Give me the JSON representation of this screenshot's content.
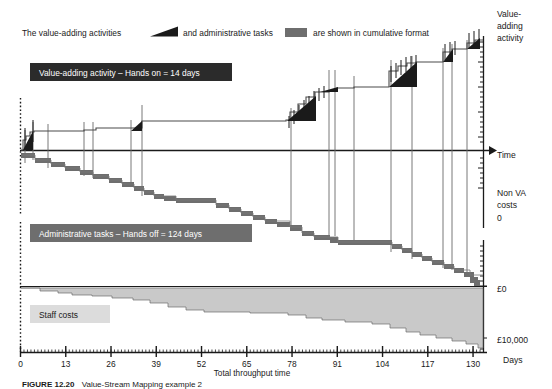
{
  "legend": {
    "prefix": "The value-adding activities",
    "middle": "and administrative tasks",
    "suffix": "are shown in cumulative format",
    "swatch_value_adding": "value-adding-wedge",
    "swatch_admin": "admin-block",
    "color_value_adding": "#1a1a1a",
    "color_admin": "#6e6e6e"
  },
  "callouts": {
    "value_adding": "Value-adding activity – Hands on = 14 days",
    "administrative": "Administrative tasks – Hands off = 124 days",
    "staff_costs": "Staff costs"
  },
  "axes": {
    "x_title": "Total throughput time",
    "x_unit_label": "Days",
    "x_ticks": [
      "0",
      "13",
      "26",
      "39",
      "52",
      "65",
      "78",
      "91",
      "104",
      "117",
      "130"
    ],
    "x_min": 0,
    "x_max": 133,
    "right_labels": {
      "top": "Value-adding activity",
      "time": "Time",
      "non_va": "Non VA costs",
      "zero_upper": "0",
      "money_zero": "£0",
      "money_ten_k": "£10,000"
    }
  },
  "caption": {
    "figure_no": "FIGURE 12.20",
    "text": "Value-Stream Mapping example 2"
  },
  "chart_data": {
    "type": "area",
    "xlabel": "Total throughput time",
    "ylabel": "Value-adding activity / Non VA costs / Staff costs",
    "xlim": [
      0,
      133
    ],
    "x_tick_values": [
      0,
      13,
      26,
      39,
      52,
      65,
      78,
      91,
      104,
      117,
      130
    ],
    "grid": false,
    "legend_position": "top",
    "annotations": [
      "Value-adding activity – Hands on = 14 days",
      "Administrative tasks – Hands off = 124 days",
      "Staff costs"
    ],
    "series": [
      {
        "name": "Value-adding activity (cumulative, upward staircase)",
        "units": "days hands-on",
        "total": 14,
        "x": [
          0,
          1,
          2,
          3,
          5,
          7,
          9,
          11,
          14,
          20,
          30,
          38,
          40,
          42,
          44,
          46,
          55,
          60,
          62,
          64,
          66,
          68,
          70,
          72,
          74,
          76,
          78,
          80,
          82,
          84,
          86,
          88,
          90,
          92,
          94,
          95,
          99,
          101,
          103,
          105,
          107,
          109,
          111,
          113,
          115,
          117,
          119,
          121,
          123,
          125,
          127,
          129,
          131,
          133
        ],
        "y": [
          0.0,
          0.3,
          0.7,
          1.1,
          1.4,
          1.5,
          1.6,
          1.7,
          1.8,
          1.8,
          1.8,
          1.9,
          2.2,
          2.5,
          2.9,
          3.0,
          3.0,
          3.0,
          3.4,
          3.9,
          4.4,
          4.9,
          5.4,
          5.8,
          6.2,
          6.6,
          7.0,
          7.0,
          7.0,
          7.0,
          7.0,
          7.0,
          7.0,
          7.0,
          7.0,
          9.0,
          9.6,
          10.2,
          10.8,
          11.0,
          11.0,
          11.6,
          12.2,
          12.6,
          12.9,
          13.0,
          13.4,
          13.6,
          13.8,
          14.0,
          14.0,
          14.0,
          14.0,
          14.0
        ]
      },
      {
        "name": "Administrative tasks (cumulative, downward staircase)",
        "units": "days hands-off",
        "total": 124,
        "x": [
          0,
          3,
          6,
          9,
          12,
          15,
          18,
          22,
          26,
          30,
          34,
          38,
          42,
          46,
          50,
          54,
          58,
          62,
          66,
          70,
          74,
          78,
          82,
          86,
          90,
          94,
          98,
          102,
          106,
          110,
          114,
          118,
          122,
          126,
          130,
          133
        ],
        "y": [
          0,
          -6,
          -10,
          -13,
          -16,
          -19,
          -22,
          -26,
          -28,
          -31,
          -34,
          -38,
          -42,
          -46,
          -50,
          -54,
          -58,
          -62,
          -66,
          -70,
          -72,
          -74,
          -74,
          -76,
          -80,
          -86,
          -92,
          -96,
          -100,
          -104,
          -110,
          -114,
          -118,
          -122,
          -124,
          -124
        ]
      },
      {
        "name": "Staff costs (cumulative spend)",
        "units": "£",
        "min": 0,
        "max": 10000,
        "x": [
          0,
          6,
          12,
          18,
          24,
          30,
          36,
          42,
          48,
          54,
          60,
          66,
          72,
          78,
          84,
          90,
          96,
          102,
          108,
          114,
          120,
          126,
          130,
          133
        ],
        "y": [
          0,
          -300,
          -600,
          -800,
          -1000,
          -1300,
          -1800,
          -2600,
          -2900,
          -3000,
          -3100,
          -3300,
          -3600,
          -4100,
          -4400,
          -4600,
          -5000,
          -5600,
          -6400,
          -7200,
          -8100,
          -8900,
          -9500,
          -9800
        ]
      }
    ],
    "y_right_reference_labels": [
      {
        "label": "Value-adding activity",
        "position": "top"
      },
      {
        "label": "Time",
        "position": "zero-axis"
      },
      {
        "label": "Non VA costs",
        "position": "below-zero"
      },
      {
        "label": "0",
        "position": "below-zero"
      },
      {
        "label": "£0",
        "position": "cost-zero"
      },
      {
        "label": "£10,000",
        "position": "cost-max"
      }
    ]
  }
}
